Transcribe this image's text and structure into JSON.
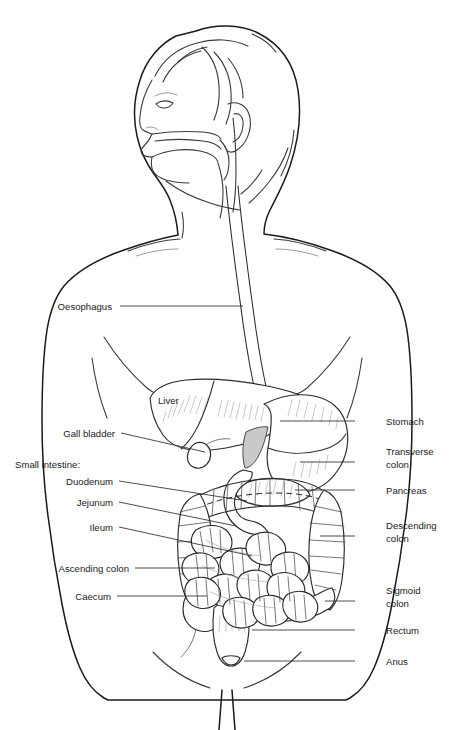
{
  "diagram": {
    "background_color": "#ffffff",
    "line_color": "#1a1a1a",
    "shade_color": "#c9c9c9"
  },
  "labels_left": [
    {
      "id": "oesophagus",
      "text": "Oesophagus",
      "x": 112,
      "y": 310,
      "leader": {
        "x1": 120,
        "y1": 306,
        "x2": 243,
        "y2": 306
      }
    },
    {
      "id": "liver",
      "text": "Liver",
      "x": 158,
      "y": 404,
      "leader": null
    },
    {
      "id": "gall-bladder",
      "text": "Gall bladder",
      "x": 115,
      "y": 437,
      "leader": {
        "x1": 121,
        "y1": 433,
        "x2": 205,
        "y2": 452
      }
    },
    {
      "id": "small-intestine",
      "text": "Small intestine:",
      "x": 15,
      "y": 468,
      "leader": null
    },
    {
      "id": "duodenum",
      "text": "Duodenum",
      "x": 113,
      "y": 485,
      "leader": {
        "x1": 119,
        "y1": 481,
        "x2": 247,
        "y2": 501
      }
    },
    {
      "id": "jejunum",
      "text": "Jejunum",
      "x": 113,
      "y": 506,
      "leader": {
        "x1": 119,
        "y1": 502,
        "x2": 236,
        "y2": 526
      }
    },
    {
      "id": "ileum",
      "text": "Ileum",
      "x": 113,
      "y": 531,
      "leader": {
        "x1": 119,
        "y1": 527,
        "x2": 252,
        "y2": 556
      }
    },
    {
      "id": "ascending-colon",
      "text": "Ascending colon",
      "x": 129,
      "y": 572,
      "leader": {
        "x1": 135,
        "y1": 568,
        "x2": 215,
        "y2": 568
      }
    },
    {
      "id": "caecum",
      "text": "Caecum",
      "x": 111,
      "y": 600,
      "leader": {
        "x1": 117,
        "y1": 596,
        "x2": 207,
        "y2": 596
      }
    }
  ],
  "labels_right": [
    {
      "id": "stomach",
      "text": "Stomach",
      "lines": [
        "Stomach"
      ],
      "x": 386,
      "y": 425,
      "leader": {
        "x1": 355,
        "y1": 421,
        "x2": 280,
        "y2": 421
      }
    },
    {
      "id": "transverse-colon",
      "text": "Transverse colon",
      "lines": [
        "Transverse",
        "colon"
      ],
      "x": 386,
      "y": 455,
      "leader": {
        "x1": 355,
        "y1": 462,
        "x2": 300,
        "y2": 462
      }
    },
    {
      "id": "pancreas",
      "text": "Pancreas",
      "lines": [
        "Pancreas"
      ],
      "x": 386,
      "y": 494,
      "leader": {
        "x1": 355,
        "y1": 490,
        "x2": 295,
        "y2": 490
      }
    },
    {
      "id": "descending-colon",
      "text": "Descending colon",
      "lines": [
        "Descending",
        "colon"
      ],
      "x": 386,
      "y": 529,
      "leader": {
        "x1": 355,
        "y1": 536,
        "x2": 320,
        "y2": 536
      }
    },
    {
      "id": "sigmoid-colon",
      "text": "Sigmoid colon",
      "lines": [
        "Sigmoid",
        "colon"
      ],
      "x": 386,
      "y": 594,
      "leader": {
        "x1": 355,
        "y1": 601,
        "x2": 325,
        "y2": 601
      }
    },
    {
      "id": "rectum",
      "text": "Rectum",
      "lines": [
        "Rectum"
      ],
      "x": 386,
      "y": 634,
      "leader": {
        "x1": 355,
        "y1": 630,
        "x2": 252,
        "y2": 630
      }
    },
    {
      "id": "anus",
      "text": "Anus",
      "lines": [
        "Anus"
      ],
      "x": 386,
      "y": 665,
      "leader": {
        "x1": 355,
        "y1": 661,
        "x2": 244,
        "y2": 661
      }
    }
  ],
  "organ_list": [
    "oesophagus",
    "liver",
    "gall bladder",
    "stomach",
    "pancreas",
    "duodenum",
    "jejunum",
    "ileum",
    "caecum",
    "ascending colon",
    "transverse colon",
    "descending colon",
    "sigmoid colon",
    "rectum",
    "anus"
  ]
}
